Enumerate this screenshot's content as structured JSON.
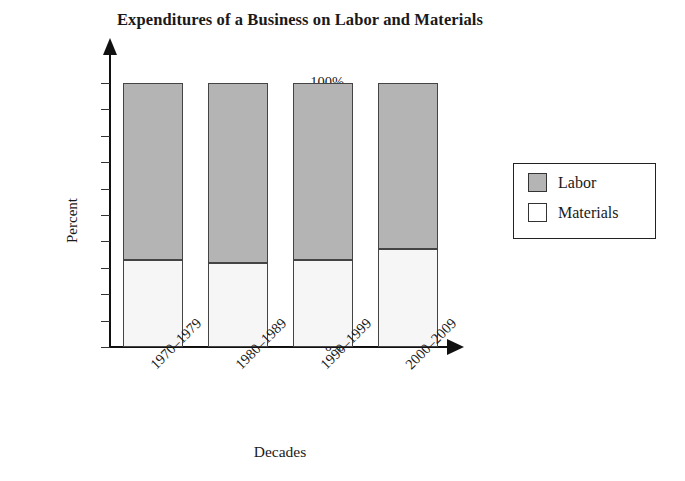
{
  "chart_data": {
    "type": "bar",
    "subtype": "stacked-100-percent",
    "title": "Expenditures of a Business on Labor and Materials",
    "xlabel": "Decades",
    "ylabel": "Percent",
    "categories": [
      "1970–1979",
      "1980–1989",
      "1990–1999",
      "2000–2009"
    ],
    "series": [
      {
        "name": "Materials",
        "values": [
          33,
          32,
          33,
          37
        ],
        "color": "#f6f6f6"
      },
      {
        "name": "Labor",
        "values": [
          67,
          68,
          67,
          63
        ],
        "color": "#b4b4b4"
      }
    ],
    "ylim": [
      0,
      100
    ],
    "ytick_labels": [
      "0%",
      "10%",
      "20%",
      "30%",
      "40%",
      "50%",
      "60%",
      "70%",
      "80%",
      "90%",
      "100%"
    ],
    "ytick_values": [
      0,
      10,
      20,
      30,
      40,
      50,
      60,
      70,
      80,
      90,
      100
    ],
    "grid": false,
    "legend_position": "right",
    "legend_entries": [
      "Labor",
      "Materials"
    ],
    "xtick_rotation_degrees": -45,
    "axis_arrows": true
  },
  "legend": {
    "items": [
      {
        "label": "Labor",
        "swatch": "gray-swatch-icon"
      },
      {
        "label": "Materials",
        "swatch": "white-swatch-icon"
      }
    ]
  }
}
